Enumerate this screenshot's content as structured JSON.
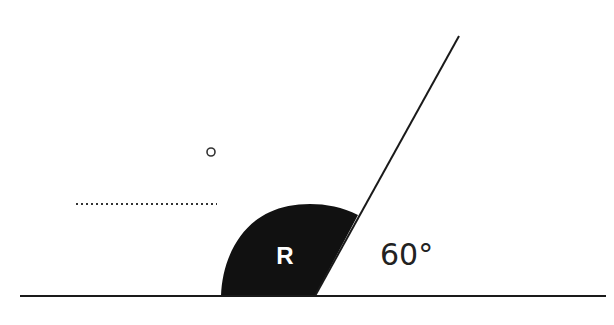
{
  "diagram": {
    "region_label": "R",
    "angle_label": "60°",
    "colors": {
      "stroke": "#1a1a1a",
      "region_fill": "#111111",
      "region_text": "#ffffff",
      "background": "#ffffff"
    },
    "baseline": {
      "x1": 20,
      "y1": 296,
      "x2": 606,
      "y2": 296
    },
    "slanted_line": {
      "x1": 315,
      "y1": 296,
      "x2": 459,
      "y2": 36,
      "angle_deg": 60
    },
    "dotted_line": {
      "x1": 76,
      "y1": 204,
      "x2": 217,
      "y2": 204
    },
    "small_circle": {
      "cx": 211,
      "cy": 152,
      "r": 4
    }
  }
}
